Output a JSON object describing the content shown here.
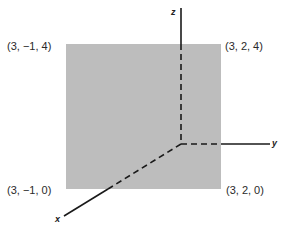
{
  "figure": {
    "kind": "3D coordinate diagram of a square in the plane x = 3",
    "square_fill": "#bdbdbd",
    "axis_color": "#1a1a1a",
    "axes": {
      "x": "x",
      "y": "y",
      "z": "z"
    },
    "corners": {
      "top_left": "(3, −1, 4)",
      "top_right": "(3, 2, 4)",
      "bottom_left": "(3, −1, 0)",
      "bottom_right": "(3, 2, 0)"
    }
  }
}
